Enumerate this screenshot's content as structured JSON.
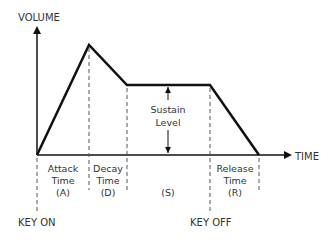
{
  "diagram": {
    "axes": {
      "y_label": "VOLUME",
      "x_label": "TIME"
    },
    "phases": [
      {
        "line1": "Attack",
        "line2": "Time",
        "line3": "(A)"
      },
      {
        "line1": "Decay",
        "line2": "Time",
        "line3": "(D)"
      },
      {
        "line1": "",
        "line2": "",
        "line3": "(S)"
      },
      {
        "line1": "Release",
        "line2": "Time",
        "line3": "(R)"
      }
    ],
    "sustain_label": {
      "line1": "Sustain",
      "line2": "Level"
    },
    "events": {
      "key_on": "KEY ON",
      "key_off": "KEY OFF"
    },
    "colors": {
      "line": "#111111",
      "dashed": "#555555",
      "text": "#333333"
    }
  }
}
